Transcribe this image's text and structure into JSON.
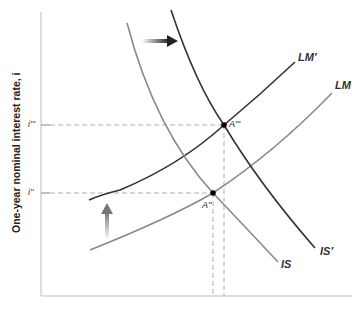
{
  "diagram": {
    "type": "IS-LM",
    "y_axis_label": "One-year nominal interest rate, i",
    "y_ticks": [
      {
        "label": "i'''",
        "y": 125
      },
      {
        "label": "i''",
        "y": 193
      }
    ],
    "curves": [
      {
        "name": "IS",
        "label": "IS",
        "color": "#8a8a8a"
      },
      {
        "name": "IS-prime",
        "label": "IS′",
        "color": "#333333"
      },
      {
        "name": "LM",
        "label": "LM",
        "color": "#8a8a8a"
      },
      {
        "name": "LM-prime",
        "label": "LM′",
        "color": "#333333"
      }
    ],
    "points": [
      {
        "name": "A-double-prime",
        "label": "A''"
      },
      {
        "name": "A-triple-prime",
        "label": "A'''"
      }
    ],
    "arrows": [
      {
        "direction": "right",
        "meaning": "IS shifts right"
      },
      {
        "direction": "up",
        "meaning": "LM shifts up"
      }
    ],
    "colors": {
      "dark": "#333333",
      "light": "#8a8a8a",
      "dashed": "#b0b0b0"
    }
  }
}
